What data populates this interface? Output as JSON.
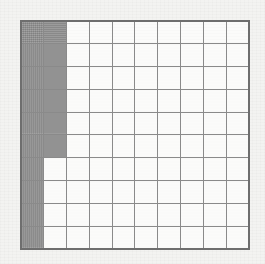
{
  "figure": {
    "title": "",
    "type": "hundred-grid",
    "rows": 10,
    "columns": 10,
    "total_cells": 100,
    "shaded_cells": 16,
    "unshaded_cells": 84,
    "fraction_shaded": "16/100",
    "decimal_shaded": "0.16",
    "percent_shaded": "16%"
  },
  "colors": {
    "shaded_fill": "#8e8e8e",
    "unshaded_fill": "#fbfbfa",
    "grid_line": "#8a8a8a",
    "outer_border": "#6e6e6e",
    "page_background": "#f3f3f1"
  },
  "chart_data": {
    "type": "heatmap",
    "title": "",
    "xlabel": "",
    "ylabel": "",
    "grid": true,
    "legend": null,
    "columns": 10,
    "rows": 10,
    "value_legend": {
      "1": "shaded",
      "0": "unshaded"
    },
    "matrix": [
      [
        1,
        1,
        0,
        0,
        0,
        0,
        0,
        0,
        0,
        0
      ],
      [
        1,
        1,
        0,
        0,
        0,
        0,
        0,
        0,
        0,
        0
      ],
      [
        1,
        1,
        0,
        0,
        0,
        0,
        0,
        0,
        0,
        0
      ],
      [
        1,
        1,
        0,
        0,
        0,
        0,
        0,
        0,
        0,
        0
      ],
      [
        1,
        1,
        0,
        0,
        0,
        0,
        0,
        0,
        0,
        0
      ],
      [
        1,
        1,
        0,
        0,
        0,
        0,
        0,
        0,
        0,
        0
      ],
      [
        1,
        0,
        0,
        0,
        0,
        0,
        0,
        0,
        0,
        0
      ],
      [
        1,
        0,
        0,
        0,
        0,
        0,
        0,
        0,
        0,
        0
      ],
      [
        1,
        0,
        0,
        0,
        0,
        0,
        0,
        0,
        0,
        0
      ],
      [
        1,
        0,
        0,
        0,
        0,
        0,
        0,
        0,
        0,
        0
      ]
    ],
    "column_shaded_counts": [
      10,
      6,
      0,
      0,
      0,
      0,
      0,
      0,
      0,
      0
    ],
    "row_shaded_counts": [
      2,
      2,
      2,
      2,
      2,
      2,
      1,
      1,
      1,
      1
    ]
  }
}
